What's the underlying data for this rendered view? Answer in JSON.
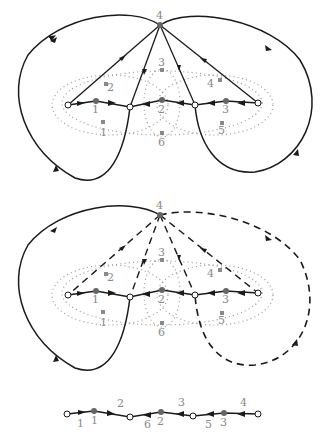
{
  "diagram": {
    "top": {
      "apex_label": "4",
      "inner_labels": [
        "1",
        "2",
        "3"
      ],
      "star_labels": [
        "1",
        "2",
        "3",
        "4",
        "5",
        "6"
      ]
    },
    "middle": {
      "apex_label": "4",
      "inner_labels": [
        "1",
        "2",
        "3"
      ],
      "star_labels": [
        "1",
        "2",
        "3",
        "4",
        "5",
        "6"
      ]
    },
    "bottom": {
      "edge_labels": [
        "1",
        "2",
        "6",
        "3",
        "5",
        "4"
      ],
      "node_labels": [
        "1",
        "2",
        "3"
      ]
    },
    "colors": {
      "stroke": "#1a1a1a",
      "dots": "#9a9a9a",
      "label": "#8a8a8a",
      "dark_node": "#666666"
    }
  }
}
